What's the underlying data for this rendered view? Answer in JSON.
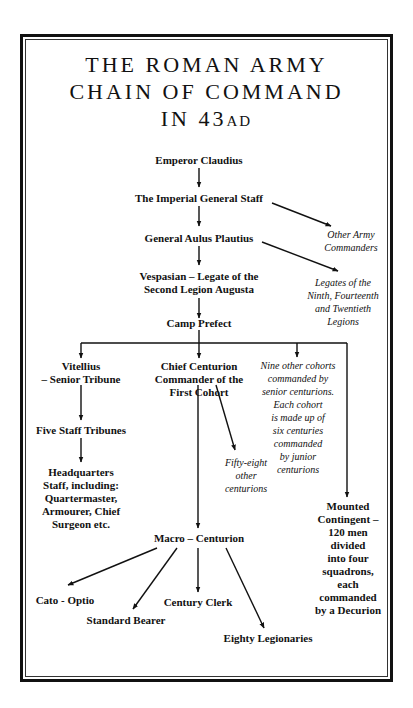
{
  "title": {
    "line1": "THE ROMAN ARMY",
    "line2": "CHAIN OF COMMAND",
    "line3_main": "IN 43",
    "line3_suffix": "AD"
  },
  "nodes": {
    "emperor": "Emperor Claudius",
    "imperial_staff": "The Imperial General Staff",
    "general": "General Aulus Plautius",
    "vespasian_1": "Vespasian – Legate of the",
    "vespasian_2": "Second Legion Augusta",
    "camp_prefect": "Camp Prefect",
    "vitellius_1": "Vitellius",
    "vitellius_2": "– Senior Tribune",
    "chief_centurion_1": "Chief Centurion",
    "chief_centurion_2": "Commander of the",
    "chief_centurion_3": "First Cohort",
    "five_staff": "Five Staff Tribunes",
    "hq_1": "Headquarters",
    "hq_2": "Staff, including:",
    "hq_3": "Quartermaster,",
    "hq_4": "Armourer, Chief",
    "hq_5": "Surgeon etc.",
    "mounted_1": "Mounted",
    "mounted_2": "Contingent –",
    "mounted_3": "120 men",
    "mounted_4": "divided",
    "mounted_5": "into four",
    "mounted_6": "squadrons,",
    "mounted_7": "each",
    "mounted_8": "commanded",
    "mounted_9": "by a Decurion",
    "macro": "Macro – Centurion",
    "cato": "Cato - Optio",
    "standard_bearer": "Standard Bearer",
    "century_clerk": "Century Clerk",
    "legionaries": "Eighty Legionaries"
  },
  "notes": {
    "other_commanders_1": "Other Army",
    "other_commanders_2": "Commanders",
    "legates_1": "Legates of the",
    "legates_2": "Ninth, Fourteenth",
    "legates_3": "and Twentieth",
    "legates_4": "Legions",
    "nine_cohorts_1": "Nine other cohorts",
    "nine_cohorts_2": "commanded by",
    "nine_cohorts_3": "senior centurions.",
    "nine_cohorts_4": "Each  cohort",
    "nine_cohorts_5": "is made up of",
    "nine_cohorts_6": "six centuries",
    "nine_cohorts_7": "commanded",
    "nine_cohorts_8": "by junior",
    "nine_cohorts_9": "centurions",
    "fifty_eight_1": "Fifty-eight",
    "fifty_eight_2": "other",
    "fifty_eight_3": "centurions"
  },
  "colors": {
    "ink": "#111111",
    "background": "#ffffff"
  }
}
